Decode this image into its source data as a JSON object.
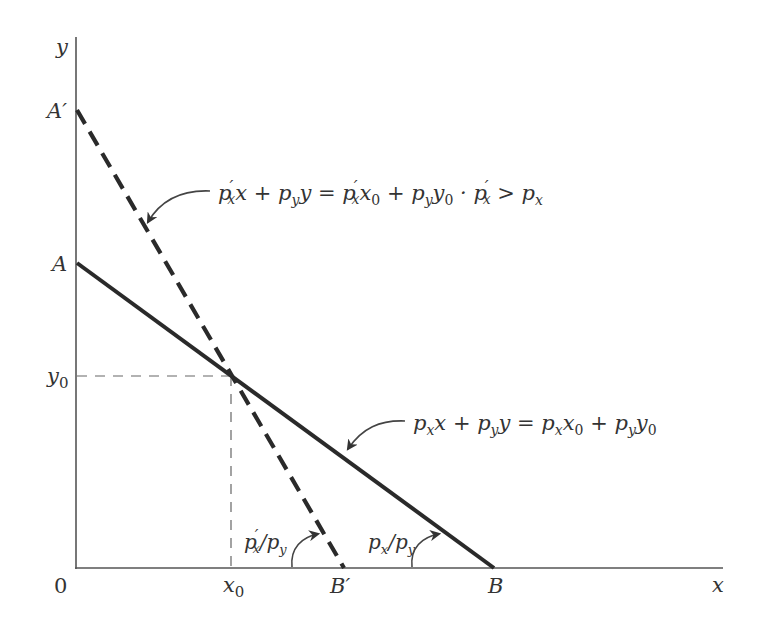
{
  "diagram": {
    "type": "budget-constraint",
    "colors": {
      "line": "#2a2a2a",
      "axis": "#555555",
      "text": "#333333",
      "background": "#ffffff"
    },
    "axes": {
      "x_label": "x",
      "y_label": "y",
      "origin_label": "0"
    },
    "points": {
      "A_prime": "A′",
      "A": "A",
      "y0": "y",
      "y0_sub": "0",
      "x0": "x",
      "x0_sub": "0",
      "B_prime": "B′",
      "B": "B"
    },
    "lines": [
      {
        "id": "original",
        "style": "solid",
        "equation": "pₓx + p_yy = pₓx₀ + p_yy₀",
        "from": "A",
        "to": "B",
        "slope_label": "pₓ/p_y"
      },
      {
        "id": "new",
        "style": "dashed",
        "equation": "p′ₓx + p_yy = p′ₓx₀ + p_yy₀ · p′ₓ > pₓ",
        "from": "A′",
        "to": "B′",
        "slope_label": "p′ₓ/p_y"
      }
    ],
    "labels": {
      "new_line_eq": {
        "p1": "p",
        "p1_prime": "′",
        "p1_sub": "x",
        "t1": "x + ",
        "p2": "p",
        "p2_sub": "y",
        "t2": "y = ",
        "p3": "p",
        "p3_prime": "′",
        "p3_sub": "x",
        "t3": "x",
        "t3_sub": "0",
        "t4": " + ",
        "p4": "p",
        "p4_sub": "y",
        "t5": "y",
        "t5_sub": "0",
        "t6": " · ",
        "p5": "p",
        "p5_prime": "′",
        "p5_sub": "x",
        "t7": " > ",
        "p6": "p",
        "p6_sub": "x"
      },
      "orig_line_eq": {
        "p1": "p",
        "p1_sub": "x",
        "t1": "x + ",
        "p2": "p",
        "p2_sub": "y",
        "t2": "y = ",
        "p3": "p",
        "p3_sub": "x",
        "t3": "x",
        "t3_sub": "0",
        "t4": " + ",
        "p4": "p",
        "p4_sub": "y",
        "t5": "y",
        "t5_sub": "0"
      },
      "new_slope": {
        "p1": "p",
        "p1_prime": "′",
        "p1_sub": "x",
        "slash": "/",
        "p2": "p",
        "p2_sub": "y"
      },
      "orig_slope": {
        "p1": "p",
        "p1_sub": "x",
        "slash": "/",
        "p2": "p",
        "p2_sub": "y"
      }
    }
  }
}
